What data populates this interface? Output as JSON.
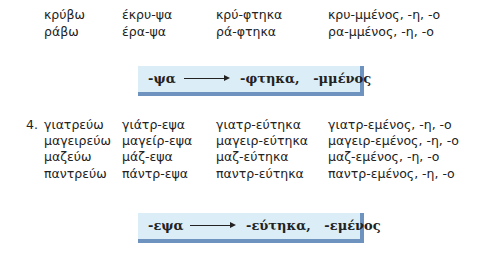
{
  "section_top": {
    "rows": [
      [
        "κρύβω",
        "έκρυ-ψα",
        "κρύ-φτηκα",
        "κρυ-μμένος, -η, -ο"
      ],
      [
        "ράβω",
        "έρα-ψα",
        "ρά-φτηκα",
        "ρα-μμένος, -η, -ο"
      ]
    ],
    "rule": {
      "from": "-ψα",
      "arrow": "arrow-right",
      "to": "-φτηκα,   -μμένος"
    }
  },
  "section_4": {
    "number": "4.",
    "rows": [
      [
        "γιατρεύω",
        "γιάτρ-εψα",
        "γιατρ-εύτηκα",
        "γιατρ-εμένος, -η, -ο"
      ],
      [
        "μαγειρεύω",
        "μαγείρ-εψα",
        "μαγειρ-εύτηκα",
        "μαγειρ-εμένος, -η, -ο"
      ],
      [
        "μαζεύω",
        "μάζ-εψα",
        "μαζ-εύτηκα",
        "μαζ-εμένος, -η, -ο"
      ],
      [
        "παντρεύω",
        "πάντρ-εψα",
        "παντρ-εύτηκα",
        "παντρ-εμένος, -η, -ο"
      ]
    ],
    "rule": {
      "from": "-εψα",
      "arrow": "arrow-right",
      "to": "-εύτηκα,   -εμένος"
    }
  },
  "colors": {
    "rule_box_fill": "#dbeef7",
    "rule_box_shadow": "#6f93bf",
    "text": "#222222"
  }
}
